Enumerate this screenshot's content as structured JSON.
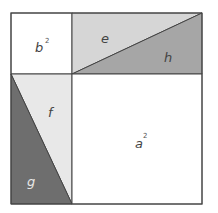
{
  "diagram": {
    "type": "pythagorean-square-dissection",
    "colors": {
      "outline": "#444444",
      "white": "#ffffff",
      "light": "#e8e8e8",
      "medium": "#d6d6d6",
      "mediumDark": "#a6a6a6",
      "dark": "#6e6e6e"
    },
    "regions": {
      "b_squared": {
        "base": "b",
        "exp": "2"
      },
      "a_squared": {
        "base": "a",
        "exp": "2"
      },
      "e": {
        "label": "e"
      },
      "h": {
        "label": "h"
      },
      "f": {
        "label": "f"
      },
      "g": {
        "label": "g"
      }
    }
  }
}
